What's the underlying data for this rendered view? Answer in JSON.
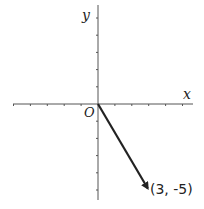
{
  "diagram": {
    "type": "coordinate-plane-vector",
    "axes": {
      "x_label": "x",
      "y_label": "y",
      "origin_label": "O",
      "x_range": [
        -5,
        5
      ],
      "y_range": [
        -5,
        5
      ],
      "tick_step": 1
    },
    "vector": {
      "from": [
        0,
        0
      ],
      "to": [
        3,
        -5
      ],
      "label": "(3, -5)"
    },
    "colors": {
      "axis": "#555555",
      "vector": "#222222",
      "background": "#ffffff"
    }
  }
}
